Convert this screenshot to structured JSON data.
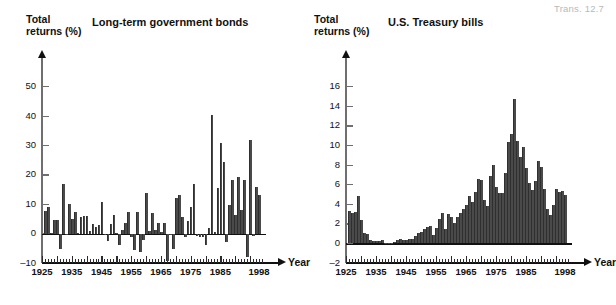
{
  "corner_note": "Trans. 12.7",
  "footer_note": "",
  "panels": [
    {
      "id": "long-term-government-bonds",
      "title": "Long-term government bonds",
      "y_caption_line1": "Total",
      "y_caption_line2": "returns (%)",
      "x_axis_word": "Year",
      "bar_color": "#4a4a4a"
    },
    {
      "id": "us-treasury-bills",
      "title": "U.S. Treasury bills",
      "y_caption_line1": "Total",
      "y_caption_line2": "returns (%)",
      "x_axis_word": "Year",
      "bar_color": "#4a4a4a"
    }
  ],
  "chart_data": [
    {
      "type": "bar",
      "title": "Long-term government bonds",
      "xlabel": "Year",
      "ylabel": "Total returns (%)",
      "ylim": [
        -10,
        55
      ],
      "yticks": [
        -10,
        0,
        10,
        20,
        30,
        40,
        50
      ],
      "ytick_labels": [
        "-10",
        "0",
        "10",
        "20",
        "30",
        "40",
        "50"
      ],
      "xlim": [
        1925,
        1999
      ],
      "xticks": [
        1925,
        1935,
        1945,
        1955,
        1965,
        1975,
        1985,
        1998
      ],
      "xtick_labels": [
        "1925",
        "1935",
        "1945",
        "1955",
        "1965",
        "1975",
        "1985",
        "1998"
      ],
      "grid": false,
      "legend": "none",
      "x": [
        1926,
        1927,
        1928,
        1929,
        1930,
        1931,
        1932,
        1933,
        1934,
        1935,
        1936,
        1937,
        1938,
        1939,
        1940,
        1941,
        1942,
        1943,
        1944,
        1945,
        1946,
        1947,
        1948,
        1949,
        1950,
        1951,
        1952,
        1953,
        1954,
        1955,
        1956,
        1957,
        1958,
        1959,
        1960,
        1961,
        1962,
        1963,
        1964,
        1965,
        1966,
        1967,
        1968,
        1969,
        1970,
        1971,
        1972,
        1973,
        1974,
        1975,
        1976,
        1977,
        1978,
        1979,
        1980,
        1981,
        1982,
        1983,
        1984,
        1985,
        1986,
        1987,
        1988,
        1989,
        1990,
        1991,
        1992,
        1993,
        1994,
        1995,
        1996,
        1997,
        1998
      ],
      "values": [
        7.8,
        8.9,
        0.1,
        4.5,
        4.7,
        -5.3,
        16.8,
        -0.1,
        10.0,
        5.0,
        7.5,
        0.2,
        5.5,
        5.9,
        6.1,
        0.9,
        3.2,
        2.1,
        2.8,
        10.7,
        -0.1,
        -2.6,
        3.4,
        6.5,
        0.1,
        -3.9,
        1.2,
        3.6,
        7.2,
        -1.3,
        -5.6,
        7.5,
        -6.1,
        -2.3,
        13.8,
        1.0,
        6.9,
        1.2,
        3.5,
        0.7,
        3.7,
        -9.2,
        -0.3,
        -5.1,
        12.1,
        13.2,
        5.7,
        -1.1,
        4.4,
        9.2,
        16.8,
        -0.7,
        -1.2,
        -1.2,
        -4.0,
        1.9,
        40.4,
        0.7,
        15.5,
        31.0,
        24.5,
        -2.7,
        9.7,
        18.1,
        6.2,
        19.3,
        8.1,
        18.2,
        -7.8,
        31.7,
        -0.9,
        15.9,
        13.1
      ]
    },
    {
      "type": "bar",
      "title": "U.S. Treasury bills",
      "xlabel": "Year",
      "ylabel": "Total returns (%)",
      "ylim": [
        -2,
        17.5
      ],
      "yticks": [
        -2,
        0,
        2,
        4,
        6,
        8,
        10,
        12,
        14,
        16
      ],
      "ytick_labels": [
        "-2",
        "0",
        "2",
        "4",
        "6",
        "8",
        "10",
        "12",
        "14",
        "16"
      ],
      "xlim": [
        1925,
        1999
      ],
      "xticks": [
        1925,
        1935,
        1945,
        1955,
        1965,
        1975,
        1985,
        1998
      ],
      "xtick_labels": [
        "1925",
        "1935",
        "1945",
        "1955",
        "1965",
        "1975",
        "1985",
        "1998"
      ],
      "grid": false,
      "legend": "none",
      "x": [
        1926,
        1927,
        1928,
        1929,
        1930,
        1931,
        1932,
        1933,
        1934,
        1935,
        1936,
        1937,
        1938,
        1939,
        1940,
        1941,
        1942,
        1943,
        1944,
        1945,
        1946,
        1947,
        1948,
        1949,
        1950,
        1951,
        1952,
        1953,
        1954,
        1955,
        1956,
        1957,
        1958,
        1959,
        1960,
        1961,
        1962,
        1963,
        1964,
        1965,
        1966,
        1967,
        1968,
        1969,
        1970,
        1971,
        1972,
        1973,
        1974,
        1975,
        1976,
        1977,
        1978,
        1979,
        1980,
        1981,
        1982,
        1983,
        1984,
        1985,
        1986,
        1987,
        1988,
        1989,
        1990,
        1991,
        1992,
        1993,
        1994,
        1995,
        1996,
        1997,
        1998
      ],
      "values": [
        3.3,
        3.1,
        3.2,
        4.8,
        2.4,
        1.1,
        1.0,
        0.3,
        0.2,
        0.2,
        0.2,
        0.3,
        0.0,
        0.0,
        0.0,
        0.1,
        0.3,
        0.4,
        0.3,
        0.3,
        0.4,
        0.5,
        0.8,
        1.1,
        1.2,
        1.5,
        1.7,
        1.8,
        0.9,
        1.6,
        2.5,
        3.1,
        1.5,
        3.0,
        2.7,
        2.1,
        2.7,
        3.1,
        3.5,
        3.9,
        4.8,
        4.2,
        5.2,
        6.6,
        6.5,
        4.4,
        3.8,
        6.9,
        8.0,
        5.8,
        5.1,
        5.1,
        7.2,
        10.4,
        11.2,
        14.7,
        10.5,
        8.8,
        9.8,
        7.7,
        6.2,
        5.5,
        6.4,
        8.4,
        7.8,
        5.6,
        3.5,
        2.9,
        3.9,
        5.6,
        5.2,
        5.3,
        4.9
      ]
    }
  ]
}
